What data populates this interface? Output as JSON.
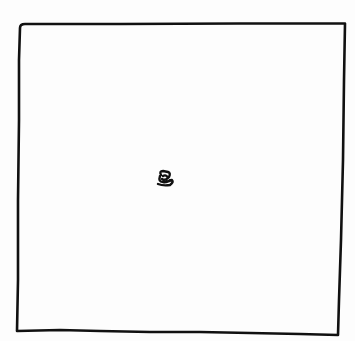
{
  "drawing": {
    "description": "Hand-drawn square outline with a small scribble near the center",
    "stroke_color": "#111111",
    "background_color": "#fdfdfd",
    "square": {
      "corners": {
        "top_left": [
          20,
          24
        ],
        "top_right": [
          345,
          23
        ],
        "bottom_right": [
          338,
          335
        ],
        "bottom_left": [
          17,
          330
        ]
      }
    },
    "scribble": {
      "center": [
        165,
        178
      ]
    }
  }
}
